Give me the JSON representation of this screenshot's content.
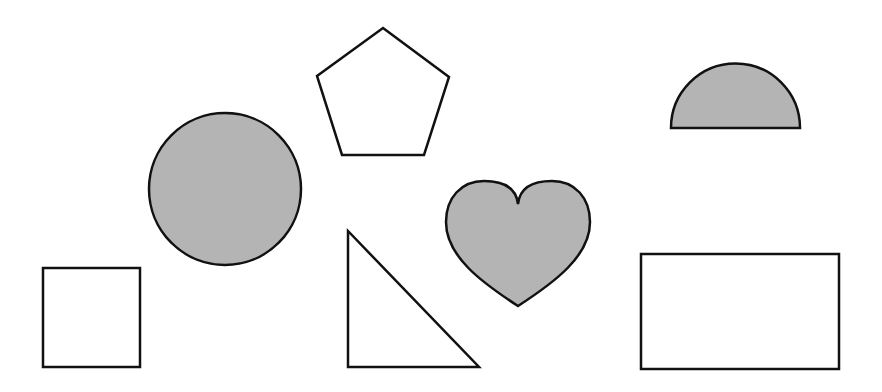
{
  "canvas": {
    "width": 882,
    "height": 392,
    "background": "#ffffff"
  },
  "colors": {
    "stroke": "#111111",
    "filled": "#b4b4b4",
    "empty": "#ffffff"
  },
  "shapes": [
    {
      "name": "pentagon",
      "filled": false,
      "points": "383,28 449,77 424,155 342,155 317,76"
    },
    {
      "name": "circle",
      "filled": true,
      "cx": 225,
      "cy": 189,
      "r": 76
    },
    {
      "name": "semicircle",
      "filled": true,
      "path": "M671,128 A64,64 0 0 1 800,128 Z"
    },
    {
      "name": "heart",
      "filled": true,
      "path": "M518,204 C520,186 536,181 552,181 C575,181 590,198 590,222 C590,256 555,282 518,306 C481,282 446,256 446,222 C446,198 461,181 484,181 C500,181 516,186 518,204 Z"
    },
    {
      "name": "square",
      "filled": false,
      "x": 43,
      "y": 268,
      "width": 97,
      "height": 99
    },
    {
      "name": "right-triangle",
      "filled": false,
      "points": "348,231 348,367 479,367"
    },
    {
      "name": "rectangle",
      "filled": false,
      "x": 641,
      "y": 254,
      "width": 198,
      "height": 115
    }
  ]
}
